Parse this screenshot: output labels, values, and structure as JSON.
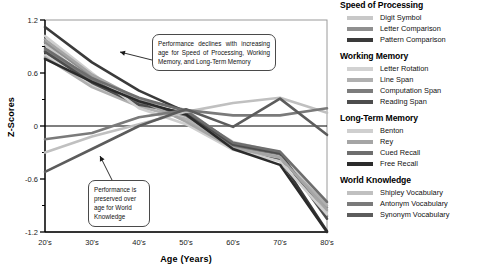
{
  "chart_data": {
    "type": "line",
    "title": "",
    "xlabel": "Age (Years)",
    "ylabel": "Z-Scores",
    "categories": [
      "20's",
      "30's",
      "40's",
      "50's",
      "60's",
      "70's",
      "80's"
    ],
    "x": [
      1,
      2,
      3,
      4,
      5,
      6,
      7
    ],
    "ylim": [
      -1.2,
      1.2
    ],
    "yticks": [
      1.2,
      0.6,
      0,
      -0.6,
      -1.2
    ],
    "ytick_labels": [
      "1.2",
      "0.6",
      "0",
      "-0.6",
      "-1.2"
    ],
    "minor_yticks": [
      0.9,
      0.3,
      -0.3,
      -0.9
    ],
    "grid": false,
    "legend_position": "right",
    "zero_line": true,
    "series": [
      {
        "name": "Digit Symbol",
        "group": "Speed of Processing",
        "color": "#c8c8c8",
        "values": [
          0.92,
          0.5,
          0.27,
          0.14,
          -0.18,
          -0.3,
          -0.97
        ]
      },
      {
        "name": "Letter Comparison",
        "group": "Speed of Processing",
        "color": "#8f8f8f",
        "values": [
          0.95,
          0.56,
          0.3,
          0.18,
          -0.2,
          -0.33,
          -0.92
        ]
      },
      {
        "name": "Pattern Comparison",
        "group": "Speed of Processing",
        "color": "#3a3a3a",
        "values": [
          1.12,
          0.72,
          0.4,
          0.16,
          -0.22,
          -0.38,
          -1.19
        ]
      },
      {
        "name": "Letter Rotation",
        "group": "Working Memory",
        "color": "#d2d2d2",
        "values": [
          0.8,
          0.46,
          0.25,
          0.1,
          -0.24,
          -0.34,
          -0.88
        ]
      },
      {
        "name": "Line Span",
        "group": "Working Memory",
        "color": "#b0b0b0",
        "values": [
          0.78,
          0.44,
          0.22,
          0.08,
          -0.26,
          -0.36,
          -0.9
        ]
      },
      {
        "name": "Computation Span",
        "group": "Working Memory",
        "color": "#7c7c7c",
        "values": [
          0.86,
          0.52,
          0.26,
          0.12,
          -0.23,
          -0.32,
          -1.02
        ]
      },
      {
        "name": "Reading Span",
        "group": "Working Memory",
        "color": "#4d4d4d",
        "values": [
          0.84,
          0.49,
          0.24,
          0.15,
          -0.21,
          -0.31,
          -1.05
        ]
      },
      {
        "name": "Benton",
        "group": "Long-Term Memory",
        "color": "#cfcfcf",
        "values": [
          1.02,
          0.6,
          0.2,
          0.02,
          -0.27,
          -0.4,
          -1.0
        ]
      },
      {
        "name": "Rey",
        "group": "Long-Term Memory",
        "color": "#a5a5a5",
        "values": [
          0.98,
          0.58,
          0.3,
          0.05,
          -0.25,
          -0.35,
          -0.95
        ]
      },
      {
        "name": "Cued Recall",
        "group": "Long-Term Memory",
        "color": "#6e6e6e",
        "values": [
          0.88,
          0.54,
          0.32,
          0.17,
          -0.19,
          -0.29,
          -0.86
        ]
      },
      {
        "name": "Free Recall",
        "group": "Long-Term Memory",
        "color": "#2b2b2b",
        "values": [
          0.76,
          0.5,
          0.28,
          0.13,
          -0.26,
          -0.44,
          -1.2
        ]
      },
      {
        "name": "Shipley Vocabulary",
        "group": "World Knowledge",
        "color": "#c0c0c0",
        "values": [
          -0.3,
          -0.12,
          0.02,
          0.16,
          0.26,
          0.32,
          0.15
        ]
      },
      {
        "name": "Antonym Vocabulary",
        "group": "World Knowledge",
        "color": "#7a7a7a",
        "values": [
          -0.15,
          -0.08,
          0.1,
          0.18,
          0.12,
          0.12,
          0.2
        ]
      },
      {
        "name": "Synonym Vocabulary",
        "group": "World Knowledge",
        "color": "#5c5c5c",
        "values": [
          -0.52,
          -0.26,
          0.0,
          0.19,
          -0.01,
          0.31,
          -0.1
        ]
      }
    ],
    "annotations": [
      {
        "id": "decline",
        "text": "Performance declines with increasing age for Speed of Processing, Working Memory, and Long-Term Memory"
      },
      {
        "id": "preserved",
        "text": "Performance is preserved over age for World Knowledge"
      }
    ]
  },
  "legend": {
    "groups": [
      {
        "heading": "Speed of Processing",
        "items": [
          {
            "label": "Digit Symbol",
            "color": "#c8c8c8"
          },
          {
            "label": "Letter Comparison",
            "color": "#8f8f8f"
          },
          {
            "label": "Pattern Comparison",
            "color": "#3a3a3a"
          }
        ]
      },
      {
        "heading": "Working Memory",
        "items": [
          {
            "label": "Letter Rotation",
            "color": "#d2d2d2"
          },
          {
            "label": "Line Span",
            "color": "#b0b0b0"
          },
          {
            "label": "Computation Span",
            "color": "#7c7c7c"
          },
          {
            "label": "Reading Span",
            "color": "#4d4d4d"
          }
        ]
      },
      {
        "heading": "Long-Term Memory",
        "items": [
          {
            "label": "Benton",
            "color": "#cfcfcf"
          },
          {
            "label": "Rey",
            "color": "#a5a5a5"
          },
          {
            "label": "Cued Recall",
            "color": "#6e6e6e"
          },
          {
            "label": "Free Recall",
            "color": "#2b2b2b"
          }
        ]
      },
      {
        "heading": "World Knowledge",
        "items": [
          {
            "label": "Shipley Vocabulary",
            "color": "#c0c0c0"
          },
          {
            "label": "Antonym Vocabulary",
            "color": "#7a7a7a"
          },
          {
            "label": "Synonym Vocabulary",
            "color": "#5c5c5c"
          }
        ]
      }
    ]
  }
}
